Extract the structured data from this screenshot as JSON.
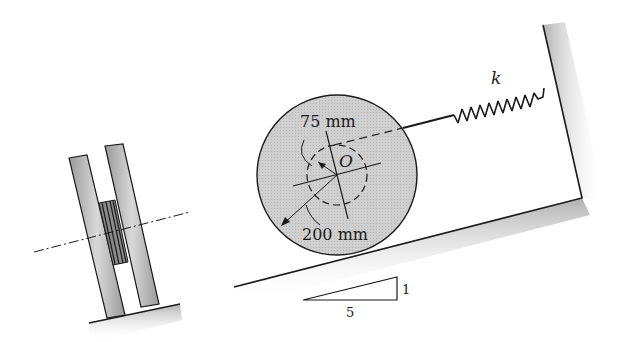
{
  "figure": {
    "type": "engineering-mechanics-diagram"
  },
  "labels": {
    "hub_radius": "75 mm",
    "wheel_radius": "200 mm",
    "center": "O",
    "spring_constant": "k",
    "slope_rise": "1",
    "slope_run": "5"
  },
  "colors": {
    "wheel_fill": "#c8c8c8",
    "line": "#1a1a1a",
    "ground_shade": "#bdbdbd"
  }
}
